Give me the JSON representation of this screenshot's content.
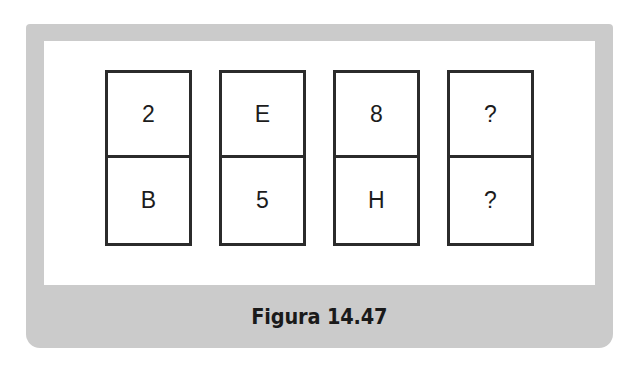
{
  "figure": {
    "caption": "Figura 14.47",
    "panel_color": "#cbcbcb",
    "plate_color": "#ffffff",
    "stroke_color": "#2b2b2b",
    "text_color": "#1c1c1c",
    "boxes": [
      {
        "top": "2",
        "bottom": "B"
      },
      {
        "top": "E",
        "bottom": "5"
      },
      {
        "top": "8",
        "bottom": "H"
      },
      {
        "top": "?",
        "bottom": "?"
      }
    ]
  },
  "chart_data": {
    "type": "table",
    "title": "Figura 14.47",
    "columns": [
      "1",
      "2",
      "3",
      "4"
    ],
    "rows": [
      {
        "label": "top",
        "values": [
          "2",
          "E",
          "8",
          "?"
        ]
      },
      {
        "label": "bottom",
        "values": [
          "B",
          "5",
          "H",
          "?"
        ]
      }
    ]
  }
}
